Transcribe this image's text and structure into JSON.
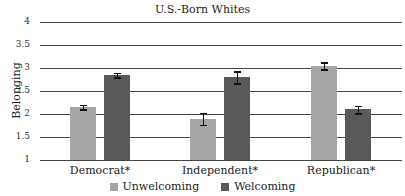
{
  "chart_data": {
    "type": "bar",
    "title": "U.S.-Born Whites",
    "xlabel": "",
    "ylabel": "Belonging",
    "ylim": [
      1,
      4
    ],
    "yticks": [
      "1",
      "1.5",
      "2",
      "2.5",
      "3",
      "3.5",
      "4"
    ],
    "grid": true,
    "legend_position": "bottom",
    "categories": [
      "Democrat*",
      "Independent*",
      "Republican*"
    ],
    "series": [
      {
        "name": "Unwelcoming",
        "color": "#a6a6a6",
        "values": [
          2.15,
          1.9,
          3.05
        ],
        "error": [
          0.05,
          0.13,
          0.08
        ]
      },
      {
        "name": "Welcoming",
        "color": "#595959",
        "values": [
          2.85,
          2.8,
          2.1
        ],
        "error": [
          0.05,
          0.13,
          0.08
        ]
      }
    ]
  }
}
